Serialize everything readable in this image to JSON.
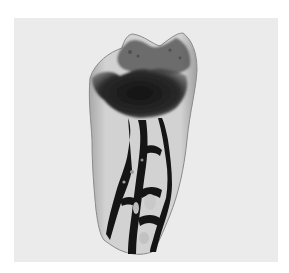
{
  "image": {
    "subject": "cleared extracted tooth specimen with dark-stained pulp chamber and root canal network",
    "colors": {
      "outer_border": "#ffffff",
      "background_panel": "#ebebeb",
      "tooth_body": "#c9c9c9",
      "tooth_translucent_edge": "#9a9a9a",
      "stain_dark": "#141414",
      "stain_mid": "#3a3a3a"
    }
  }
}
